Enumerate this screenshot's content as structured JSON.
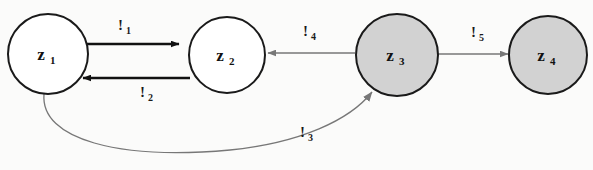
{
  "diagram": {
    "type": "state-transition-graph",
    "background_color": "#fbfbfa",
    "nodes": [
      {
        "id": "z1",
        "base": "z",
        "subscript": "1",
        "cx": 48,
        "cy": 54,
        "r": 40,
        "fill": "#ffffff",
        "stroke": "#1a1a1a",
        "stroke_width": 2,
        "shaded": "false"
      },
      {
        "id": "z2",
        "base": "z",
        "subscript": "2",
        "cx": 227,
        "cy": 55,
        "r": 38,
        "fill": "#ffffff",
        "stroke": "#1a1a1a",
        "stroke_width": 2,
        "shaded": "false"
      },
      {
        "id": "z3",
        "base": "z",
        "subscript": "3",
        "cx": 397,
        "cy": 55,
        "r": 41,
        "fill": "#d2d2d2",
        "stroke": "#1a1a1a",
        "stroke_width": 2,
        "shaded": "true"
      },
      {
        "id": "z4",
        "base": "z",
        "subscript": "4",
        "cx": 548,
        "cy": 55,
        "r": 39,
        "fill": "#d2d2d2",
        "stroke": "#1a1a1a",
        "stroke_width": 2,
        "shaded": "true"
      }
    ],
    "edges": [
      {
        "id": "e1",
        "from": "z1",
        "to": "z2",
        "base": "!",
        "subscript": "1",
        "label_x": 118,
        "label_y": 30,
        "color": "#111111",
        "stroke_width": 2.6,
        "shape": "straight"
      },
      {
        "id": "e2",
        "from": "z2",
        "to": "z1",
        "base": "!",
        "subscript": "2",
        "label_x": 140,
        "label_y": 97,
        "color": "#111111",
        "stroke_width": 2.6,
        "shape": "straight"
      },
      {
        "id": "e3",
        "from": "z1",
        "to": "z3",
        "base": "!",
        "subscript": "3",
        "label_x": 300,
        "label_y": 137,
        "color": "#777777",
        "stroke_width": 1.3,
        "shape": "curved"
      },
      {
        "id": "e4",
        "from": "z3",
        "to": "z2",
        "base": "!",
        "subscript": "4",
        "label_x": 303,
        "label_y": 36,
        "color": "#777777",
        "stroke_width": 1.4,
        "shape": "straight"
      },
      {
        "id": "e5",
        "from": "z3",
        "to": "z4",
        "base": "!",
        "subscript": "5",
        "label_x": 471,
        "label_y": 37,
        "color": "#777777",
        "stroke_width": 1.4,
        "shape": "straight"
      }
    ]
  }
}
